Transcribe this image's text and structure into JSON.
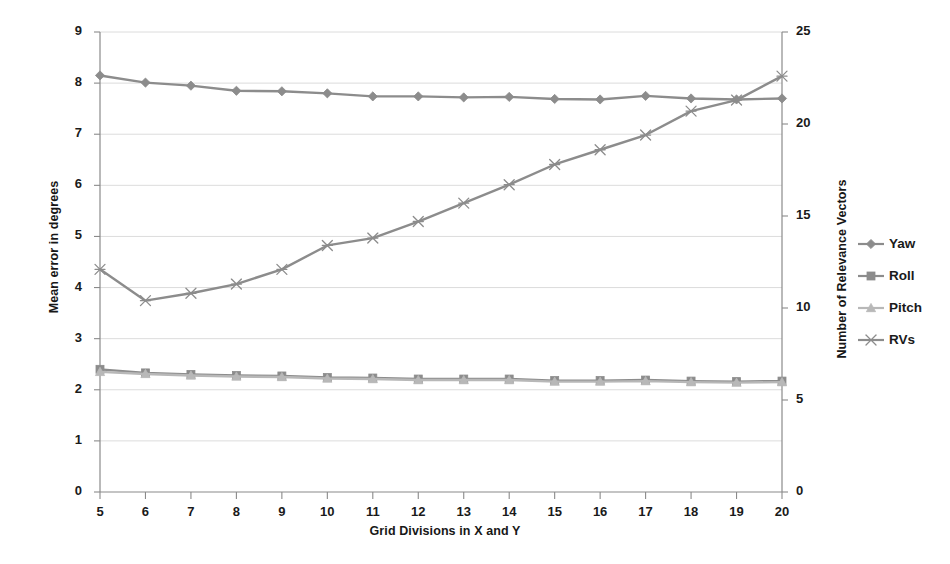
{
  "chart_data": {
    "type": "line",
    "title": "",
    "xlabel": "Grid Divisions in X and Y",
    "ylabel": "Mean error in degrees",
    "ylabel_secondary": "Number of Relevance Vectors",
    "grid": true,
    "legend_position": "right",
    "x": [
      5,
      6,
      7,
      8,
      9,
      10,
      11,
      12,
      13,
      14,
      15,
      16,
      17,
      18,
      19,
      20
    ],
    "xtick_labels": [
      "5",
      "6",
      "7",
      "8",
      "9",
      "10",
      "11",
      "12",
      "13",
      "14",
      "15",
      "16",
      "17",
      "18",
      "19",
      "20"
    ],
    "ylim": [
      0,
      9
    ],
    "ytick_labels": [
      "0",
      "1",
      "2",
      "3",
      "4",
      "5",
      "6",
      "7",
      "8",
      "9"
    ],
    "ylim_secondary": [
      0,
      25
    ],
    "ytick_labels_secondary": [
      "0",
      "5",
      "10",
      "15",
      "20",
      "25"
    ],
    "series": [
      {
        "name": "Yaw",
        "axis": "left",
        "marker": "diamond",
        "color": "#8c8c8c",
        "values": [
          8.15,
          8.01,
          7.95,
          7.85,
          7.84,
          7.8,
          7.74,
          7.74,
          7.72,
          7.73,
          7.69,
          7.68,
          7.75,
          7.7,
          7.68,
          7.7
        ]
      },
      {
        "name": "Roll",
        "axis": "left",
        "marker": "square",
        "color": "#8c8c8c",
        "values": [
          2.4,
          2.33,
          2.3,
          2.28,
          2.27,
          2.24,
          2.23,
          2.21,
          2.21,
          2.21,
          2.18,
          2.18,
          2.19,
          2.17,
          2.16,
          2.17
        ]
      },
      {
        "name": "Pitch",
        "axis": "left",
        "marker": "triangle",
        "color": "#b8b8b8",
        "values": [
          2.35,
          2.31,
          2.28,
          2.26,
          2.25,
          2.22,
          2.21,
          2.19,
          2.19,
          2.19,
          2.16,
          2.16,
          2.17,
          2.15,
          2.14,
          2.15
        ]
      },
      {
        "name": "RVs",
        "axis": "right",
        "marker": "asterisk",
        "color": "#8c8c8c",
        "values": [
          12.1,
          10.4,
          10.8,
          11.3,
          12.1,
          13.4,
          13.8,
          14.7,
          15.7,
          16.7,
          17.8,
          18.6,
          19.4,
          20.7,
          21.3,
          22.6
        ]
      }
    ]
  },
  "axes": {
    "left_title": "Mean error in degrees",
    "right_title": "Number of Relevance Vectors",
    "x_title": "Grid Divisions in X and Y"
  },
  "legend": {
    "items": [
      {
        "label": "Yaw",
        "marker": "diamond",
        "color": "#8c8c8c"
      },
      {
        "label": "Roll",
        "marker": "square",
        "color": "#8c8c8c"
      },
      {
        "label": "Pitch",
        "marker": "triangle",
        "color": "#b8b8b8"
      },
      {
        "label": "RVs",
        "marker": "asterisk",
        "color": "#8c8c8c"
      }
    ]
  },
  "colors": {
    "grid": "#d8d8d8",
    "axis": "#8a8a8a",
    "text": "#1a1a1a",
    "background": "#ffffff"
  }
}
